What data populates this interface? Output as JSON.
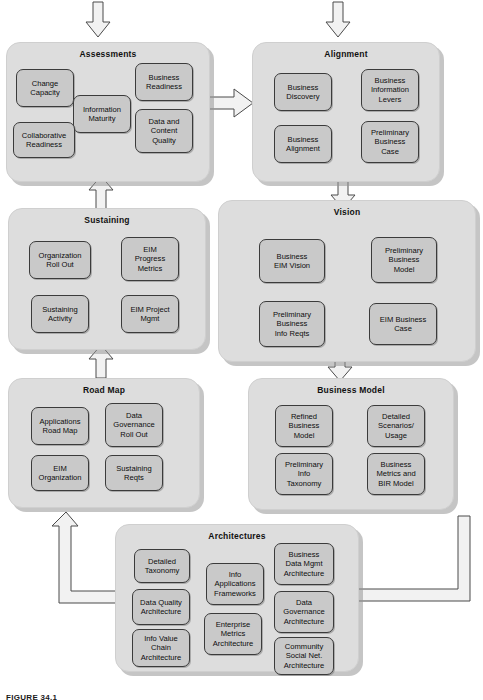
{
  "figure": {
    "caption": "FIGURE 34.1",
    "colors": {
      "page_background": "#ffffff",
      "panel_fill": "#dddddd",
      "node_fill": "#c9c9c9",
      "node_border": "#3b3b3b",
      "arrow_fill": "#f2f2f2",
      "arrow_stroke": "#4a4a4a",
      "text": "#0d0d0d"
    }
  },
  "panels": [
    {
      "id": "assessments",
      "title": "Assessments",
      "nodes": [
        {
          "label": "Change\nCapacity"
        },
        {
          "label": "Business\nReadiness"
        },
        {
          "label": "Information\nMaturity"
        },
        {
          "label": "Collaborative\nReadiness"
        },
        {
          "label": "Data and\nContent\nQuality"
        }
      ]
    },
    {
      "id": "alignment",
      "title": "Alignment",
      "nodes": [
        {
          "label": "Business\nDiscovery"
        },
        {
          "label": "Business\nInformation\nLevers"
        },
        {
          "label": "Business\nAlignment"
        },
        {
          "label": "Preliminary\nBusiness\nCase"
        }
      ]
    },
    {
      "id": "sustaining",
      "title": "Sustaining",
      "nodes": [
        {
          "label": "Organization\nRoll Out"
        },
        {
          "label": "EIM\nProgress\nMetrics"
        },
        {
          "label": "Sustaining\nActivity"
        },
        {
          "label": "EIM Project\nMgmt"
        }
      ]
    },
    {
      "id": "vision",
      "title": "Vision",
      "nodes": [
        {
          "label": "Business\nEIM Vision"
        },
        {
          "label": "Preliminary\nBusiness\nModel"
        },
        {
          "label": "Preliminary\nBusiness\nInfo Reqts"
        },
        {
          "label": "EIM Business\nCase"
        }
      ]
    },
    {
      "id": "roadmap",
      "title": "Road Map",
      "nodes": [
        {
          "label": "Applications\nRoad Map"
        },
        {
          "label": "Data\nGovernance\nRoll Out"
        },
        {
          "label": "EIM\nOrganization"
        },
        {
          "label": "Sustaining\nReqts"
        }
      ]
    },
    {
      "id": "business-model",
      "title": "Business Model",
      "nodes": [
        {
          "label": "Refined\nBusiness\nModel"
        },
        {
          "label": "Detailed\nScenarios/\nUsage"
        },
        {
          "label": "Preliminary\nInfo\nTaxonomy"
        },
        {
          "label": "Business\nMetrics and\nBIR Model"
        }
      ]
    },
    {
      "id": "architectures",
      "title": "Architectures",
      "nodes": [
        {
          "label": "Detailed\nTaxonomy"
        },
        {
          "label": "Info\nApplications\nFrameworks"
        },
        {
          "label": "Business\nData Mgmt\nArchitecture"
        },
        {
          "label": "Data Quality\nArchitecture"
        },
        {
          "label": "Enterprise\nMetrics\nArchitecture"
        },
        {
          "label": "Data\nGovernance\nArchitecture"
        },
        {
          "label": "Info Value\nChain\nArchitecture"
        },
        {
          "label": "Community\nSocial Net.\nArchitecture"
        }
      ]
    }
  ],
  "arrows": [
    {
      "id": "into-assessments",
      "direction": "down",
      "from": "",
      "to": "assessments"
    },
    {
      "id": "into-alignment",
      "direction": "down",
      "from": "",
      "to": "alignment"
    },
    {
      "id": "assessments-to-alignment",
      "direction": "right",
      "from": "assessments",
      "to": "alignment"
    },
    {
      "id": "alignment-to-vision",
      "direction": "down",
      "from": "alignment",
      "to": "vision"
    },
    {
      "id": "sustaining-to-assessments",
      "direction": "up",
      "from": "sustaining",
      "to": "assessments"
    },
    {
      "id": "roadmap-to-sustaining",
      "direction": "up",
      "from": "roadmap",
      "to": "sustaining"
    },
    {
      "id": "vision-to-business-model",
      "direction": "down",
      "from": "vision",
      "to": "business-model"
    },
    {
      "id": "business-model-to-architectures",
      "direction": "left",
      "from": "business-model",
      "to": "architectures"
    },
    {
      "id": "architectures-to-roadmap",
      "direction": "up",
      "from": "architectures",
      "to": "roadmap"
    }
  ]
}
